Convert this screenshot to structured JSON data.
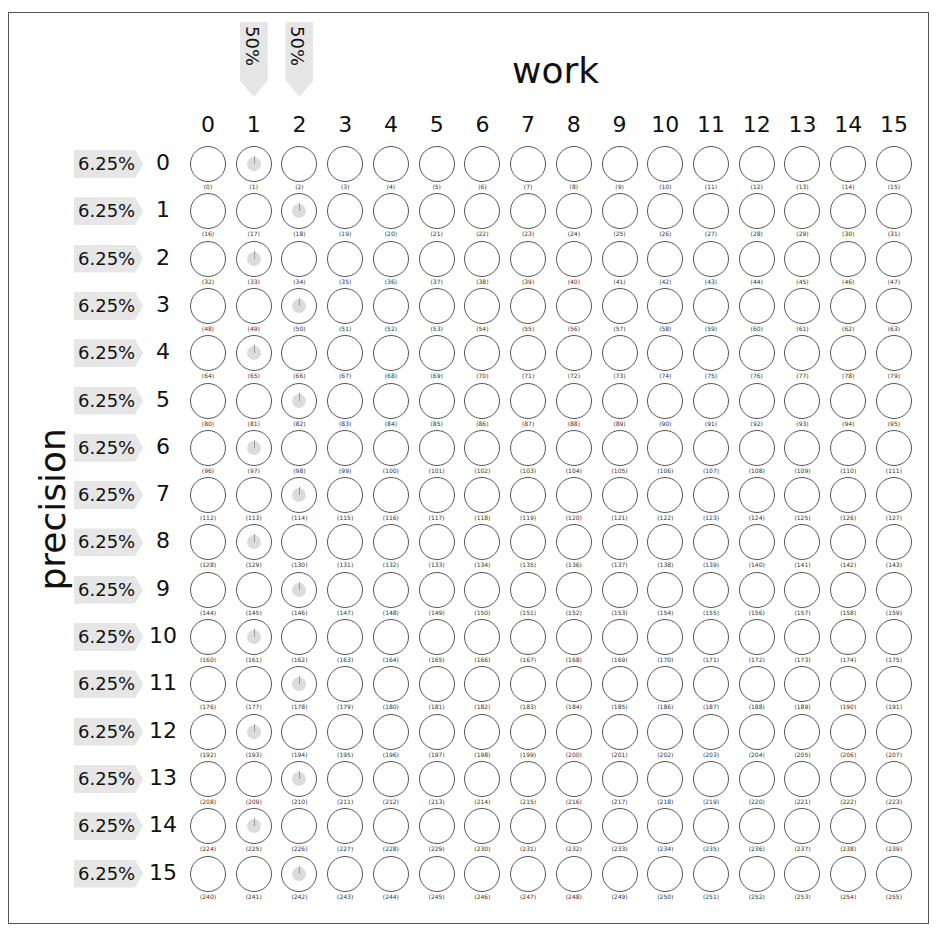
{
  "axes": {
    "x_title": "work",
    "y_title": "precision",
    "columns": [
      "0",
      "1",
      "2",
      "3",
      "4",
      "5",
      "6",
      "7",
      "8",
      "9",
      "10",
      "11",
      "12",
      "13",
      "14",
      "15"
    ],
    "rows": [
      "0",
      "1",
      "2",
      "3",
      "4",
      "5",
      "6",
      "7",
      "8",
      "9",
      "10",
      "11",
      "12",
      "13",
      "14",
      "15"
    ],
    "row_percent": "6.25%",
    "column_percents": {
      "1": "50%",
      "2": "50%"
    }
  },
  "grid": {
    "size": 16,
    "marked_rule": "even rows marked in column 1, odd rows marked in column 2",
    "marked_cells": [
      1,
      18,
      33,
      50,
      65,
      82,
      97,
      114,
      129,
      146,
      161,
      178,
      193,
      210,
      225,
      242
    ]
  },
  "colors": {
    "badge": "#e6e6e6",
    "stroke": "#555555",
    "marker": "#dcdcdc"
  }
}
